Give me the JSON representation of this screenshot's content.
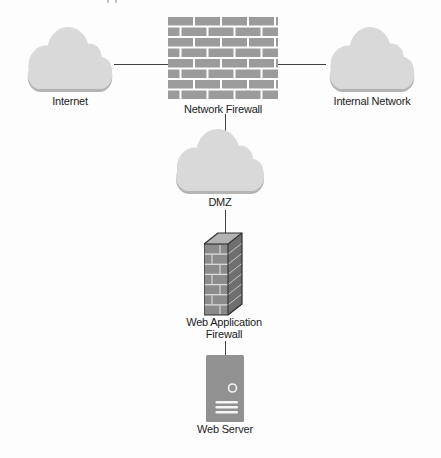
{
  "diagram": {
    "type": "network-topology",
    "nodes": [
      {
        "id": "internet",
        "label": "Internet",
        "icon": "cloud-icon"
      },
      {
        "id": "network-firewall",
        "label": "Network Firewall",
        "icon": "brick-wall-icon"
      },
      {
        "id": "internal-network",
        "label": "Internal Network",
        "icon": "cloud-icon"
      },
      {
        "id": "dmz",
        "label": "DMZ",
        "icon": "cloud-icon"
      },
      {
        "id": "web-application-firewall",
        "label": "Web Application Firewall",
        "label_lines": [
          "Web Application",
          "Firewall"
        ],
        "icon": "brick-tower-icon"
      },
      {
        "id": "web-server",
        "label": "Web Server",
        "icon": "server-icon"
      }
    ],
    "edges": [
      {
        "from": "internet",
        "to": "network-firewall"
      },
      {
        "from": "network-firewall",
        "to": "internal-network"
      },
      {
        "from": "network-firewall",
        "to": "dmz"
      },
      {
        "from": "dmz",
        "to": "web-application-firewall"
      },
      {
        "from": "web-application-firewall",
        "to": "web-server"
      }
    ],
    "colors": {
      "background": "#fdfdfd",
      "cloud_fill": "#d9d9d9",
      "cloud_shadow": "#b4b4b4",
      "brick_gray": "#9b9b9b",
      "mortar_white": "#ffffff",
      "waf_front": "#8b8b8b",
      "waf_side": "#6f6f6f",
      "waf_top": "#b2b2b2",
      "server_gray": "#919191",
      "connector_line": "#414141",
      "label_text": "#1c1c1c"
    }
  }
}
